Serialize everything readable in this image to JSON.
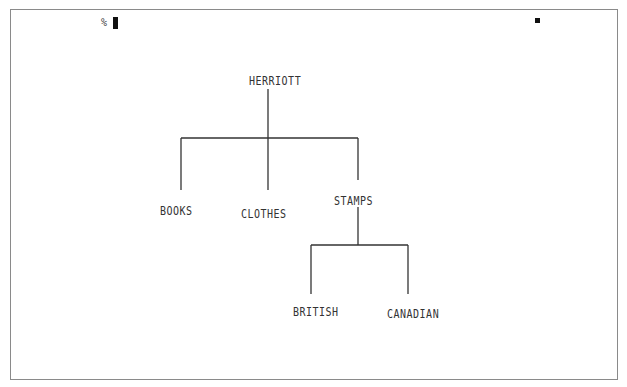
{
  "terminal": {
    "prompt": "%",
    "cursor_visible": true,
    "marker_visible": true
  },
  "tree": {
    "root": {
      "label": "HERRIOTT",
      "children": [
        {
          "label": "BOOKS"
        },
        {
          "label": "CLOTHES"
        },
        {
          "label": "STAMPS",
          "children": [
            {
              "label": "BRITISH"
            },
            {
              "label": "CANADIAN"
            }
          ]
        }
      ]
    }
  },
  "colors": {
    "line": "#333333",
    "text": "#333333",
    "frame": "#8a8a8a",
    "background": "#ffffff"
  }
}
